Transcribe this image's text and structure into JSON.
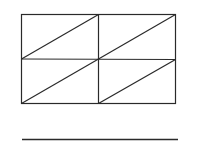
{
  "figure": {
    "stroke_color": "#2a2a2a",
    "grid": {
      "rows": 2,
      "cols": 2,
      "diagonal_direction": "bottom-left to top-right"
    },
    "answer_line": true
  }
}
